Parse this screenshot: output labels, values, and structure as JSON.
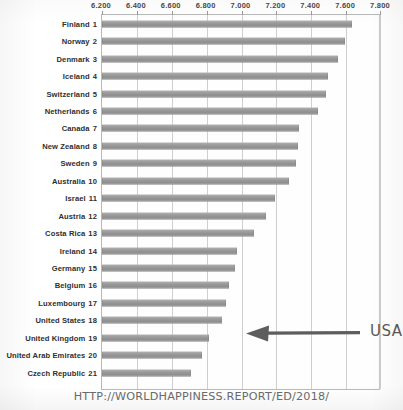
{
  "chart_data": {
    "type": "bar",
    "orientation": "horizontal",
    "title": "",
    "xlabel": "",
    "ylabel": "",
    "xlim": [
      6.2,
      7.8
    ],
    "grid": true,
    "legend": null,
    "xticks": [
      "6.200",
      "6.400",
      "6.600",
      "6.800",
      "7.000",
      "7.200",
      "7.400",
      "7.600",
      "7.800"
    ],
    "xtick_values": [
      6.2,
      6.4,
      6.6,
      6.8,
      7.0,
      7.2,
      7.4,
      7.6,
      7.8
    ],
    "categories": [
      "Finland 1",
      "Norway 2",
      "Denmark 3",
      "Iceland 4",
      "Switzerland 5",
      "Netherlands 6",
      "Canada 7",
      "New Zealand 8",
      "Sweden 9",
      "Australia 10",
      "Israel 11",
      "Austria 12",
      "Costa Rica 13",
      "Ireland 14",
      "Germany 15",
      "Belgium 16",
      "Luxembourg 17",
      "United States 18",
      "United Kingdom 19",
      "United Arab Emirates 20",
      "Czech Republic 21"
    ],
    "values": [
      7.632,
      7.594,
      7.555,
      7.495,
      7.487,
      7.441,
      7.328,
      7.324,
      7.314,
      7.272,
      7.19,
      7.139,
      7.072,
      6.977,
      6.965,
      6.927,
      6.91,
      6.886,
      6.814,
      6.774,
      6.711
    ],
    "bar_color": "#9b9b9b",
    "annotations": [
      {
        "label": "USA",
        "points_to": "United States 18",
        "style": "hand-drawn-arrow-left"
      }
    ]
  },
  "rows": [
    {
      "country": "Finland",
      "rank": "1",
      "value": 7.632
    },
    {
      "country": "Norway",
      "rank": "2",
      "value": 7.594
    },
    {
      "country": "Denmark",
      "rank": "3",
      "value": 7.555
    },
    {
      "country": "Iceland",
      "rank": "4",
      "value": 7.495
    },
    {
      "country": "Switzerland",
      "rank": "5",
      "value": 7.487
    },
    {
      "country": "Netherlands",
      "rank": "6",
      "value": 7.441
    },
    {
      "country": "Canada",
      "rank": "7",
      "value": 7.328
    },
    {
      "country": "New Zealand",
      "rank": "8",
      "value": 7.324
    },
    {
      "country": "Sweden",
      "rank": "9",
      "value": 7.314
    },
    {
      "country": "Australia",
      "rank": "10",
      "value": 7.272
    },
    {
      "country": "Israel",
      "rank": "11",
      "value": 7.19
    },
    {
      "country": "Austria",
      "rank": "12",
      "value": 7.139
    },
    {
      "country": "Costa Rica",
      "rank": "13",
      "value": 7.072
    },
    {
      "country": "Ireland",
      "rank": "14",
      "value": 6.977
    },
    {
      "country": "Germany",
      "rank": "15",
      "value": 6.965
    },
    {
      "country": "Belgium",
      "rank": "16",
      "value": 6.927
    },
    {
      "country": "Luxembourg",
      "rank": "17",
      "value": 6.91
    },
    {
      "country": "United States",
      "rank": "18",
      "value": 6.886
    },
    {
      "country": "United Kingdom",
      "rank": "19",
      "value": 6.814
    },
    {
      "country": "United Arab Emirates",
      "rank": "20",
      "value": 6.774
    },
    {
      "country": "Czech Republic",
      "rank": "21",
      "value": 6.711
    }
  ],
  "annotation": {
    "label": "USA"
  },
  "source": {
    "url_text": "HTTP://WORLDHAPPINESS.REPORT/ED/2018/"
  },
  "colors": {
    "bar": "#9b9b9b",
    "gridline": "#cfcfcf",
    "text": "#2f2f2f",
    "annotation": "#5a5a5a"
  }
}
